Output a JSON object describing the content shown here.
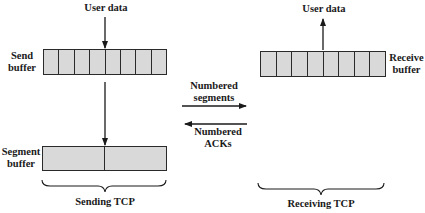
{
  "diagram": {
    "sending": {
      "user_data_label": "User data",
      "send_buffer_label_line1": "Send",
      "send_buffer_label_line2": "buffer",
      "send_buffer_cells": 8,
      "segment_buffer_label_line1": "Segment",
      "segment_buffer_label_line2": "buffer",
      "segment_buffer_cells": 2,
      "group_label": "Sending TCP"
    },
    "receiving": {
      "user_data_label": "User data",
      "receive_buffer_label_line1": "Receive",
      "receive_buffer_label_line2": "buffer",
      "receive_buffer_cells": 8,
      "group_label": "Receiving TCP"
    },
    "channel": {
      "segments_label_line1": "Numbered",
      "segments_label_line2": "segments",
      "acks_label_line1": "Numbered",
      "acks_label_line2": "ACKs"
    },
    "colors": {
      "buffer_fill": "#d9d9d9",
      "stroke": "#2a2a2a"
    }
  }
}
